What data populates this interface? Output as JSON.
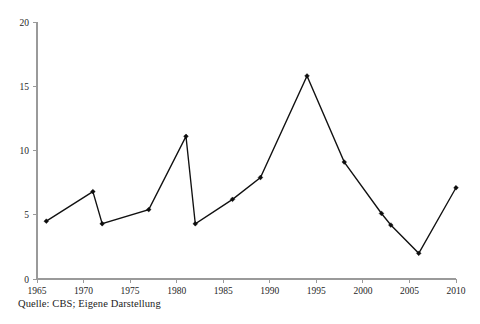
{
  "caption": "Quelle: CBS; Eigene Darstellung",
  "chart_data": {
    "type": "line",
    "title": "",
    "subtitle": "",
    "xlabel": "",
    "ylabel": "",
    "xlim": [
      1965,
      2010
    ],
    "ylim": [
      0,
      20
    ],
    "grid": false,
    "legend": null,
    "legend_position": "none",
    "marker": "filled-diamond",
    "line_color": "#111111",
    "marker_color": "#0d0d0d",
    "axis_color": "#9a9a9a",
    "xticks": [
      1965,
      1970,
      1975,
      1980,
      1985,
      1990,
      1995,
      2000,
      2005,
      2010
    ],
    "xtick_labels": [
      "1965",
      "1970",
      "1975",
      "1980",
      "1985",
      "1990",
      "1995",
      "2000",
      "2005",
      "2010"
    ],
    "yticks": [
      0,
      5,
      10,
      15,
      20
    ],
    "ytick_labels": [
      "0",
      "5",
      "10",
      "15",
      "20"
    ],
    "x": [
      1966,
      1971,
      1972,
      1977,
      1981,
      1982,
      1986,
      1989,
      1994,
      1998,
      2002,
      2003,
      2006,
      2010
    ],
    "values": [
      4.5,
      6.8,
      4.3,
      5.4,
      11.1,
      4.3,
      6.2,
      7.9,
      15.8,
      9.1,
      5.1,
      4.2,
      2.0,
      7.1
    ],
    "points": [
      {
        "x": 1966,
        "y": 4.5
      },
      {
        "x": 1971,
        "y": 6.8
      },
      {
        "x": 1972,
        "y": 4.3
      },
      {
        "x": 1977,
        "y": 5.4
      },
      {
        "x": 1981,
        "y": 11.1
      },
      {
        "x": 1982,
        "y": 4.3
      },
      {
        "x": 1986,
        "y": 6.2
      },
      {
        "x": 1989,
        "y": 7.9
      },
      {
        "x": 1994,
        "y": 15.8
      },
      {
        "x": 1998,
        "y": 9.1
      },
      {
        "x": 2002,
        "y": 5.1
      },
      {
        "x": 2003,
        "y": 4.2
      },
      {
        "x": 2006,
        "y": 2.0
      },
      {
        "x": 2010,
        "y": 7.1
      }
    ]
  }
}
